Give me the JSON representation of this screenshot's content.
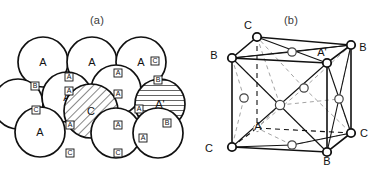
{
  "figure": {
    "panels": [
      {
        "id": "a",
        "caption": "(a)",
        "description": "Close-packed layer of spheres showing A, B and C stacking sites",
        "type": "sphere-packing"
      },
      {
        "id": "b",
        "caption": "(b)",
        "description": "Face-centred cubic unit cell with corner and face-centre atoms labelled",
        "type": "unit-cell"
      }
    ]
  },
  "panel_a": {
    "caption": "(a)",
    "spheres": [
      {
        "name": "sphere-a-top-left",
        "label": "A",
        "cx": 43,
        "cy": 62,
        "r": 25,
        "fill": "plain"
      },
      {
        "name": "sphere-a-top-mid",
        "label": "A",
        "cx": 92,
        "cy": 62,
        "r": 25,
        "fill": "plain"
      },
      {
        "name": "sphere-a-top-right",
        "label": "A",
        "cx": 141,
        "cy": 62,
        "r": 25,
        "fill": "plain"
      },
      {
        "name": "sphere-row2-left",
        "label": "",
        "cx": 18,
        "cy": 104,
        "r": 25,
        "fill": "plain"
      },
      {
        "name": "sphere-a-row2-mid",
        "label": "A",
        "cx": 67,
        "cy": 97,
        "r": 25,
        "fill": "plain"
      },
      {
        "name": "sphere-row2-mid2",
        "label": "",
        "cx": 116,
        "cy": 90,
        "r": 25,
        "fill": "plain"
      },
      {
        "name": "sphere-a-prime",
        "label": "A'",
        "cx": 160,
        "cy": 104,
        "r": 25,
        "fill": "horizontal-hatch"
      },
      {
        "name": "sphere-c-center",
        "label": "C",
        "cx": 91,
        "cy": 111,
        "r": 27,
        "fill": "diagonal-hatch"
      },
      {
        "name": "sphere-a-bottom-left",
        "label": "A",
        "cx": 40,
        "cy": 132,
        "r": 25,
        "fill": "plain"
      },
      {
        "name": "sphere-bottom-mid",
        "label": "",
        "cx": 116,
        "cy": 133,
        "r": 25,
        "fill": "plain"
      },
      {
        "name": "sphere-bottom-right",
        "label": "",
        "cx": 158,
        "cy": 133,
        "r": 25,
        "fill": "plain"
      }
    ],
    "site_labels": [
      {
        "name": "site-label-a-1",
        "label": "A",
        "x": 69,
        "y": 79
      },
      {
        "name": "site-label-a-2",
        "label": "A",
        "x": 118,
        "y": 75
      },
      {
        "name": "site-label-a-3",
        "label": "A",
        "x": 69,
        "y": 93
      },
      {
        "name": "site-label-a-4",
        "label": "A",
        "x": 118,
        "y": 96
      },
      {
        "name": "site-label-a-5",
        "label": "A",
        "x": 139,
        "y": 111
      },
      {
        "name": "site-label-a-6",
        "label": "A",
        "x": 70,
        "y": 127
      },
      {
        "name": "site-label-a-7",
        "label": "A",
        "x": 118,
        "y": 127
      },
      {
        "name": "site-label-a-8",
        "label": "A",
        "x": 143,
        "y": 140
      },
      {
        "name": "site-label-b-1",
        "label": "B",
        "x": 35,
        "y": 88
      },
      {
        "name": "site-label-b-2",
        "label": "B",
        "x": 158,
        "y": 82
      },
      {
        "name": "site-label-b-3",
        "label": "B",
        "x": 167,
        "y": 125
      },
      {
        "name": "site-label-c-1",
        "label": "C",
        "x": 36,
        "y": 112
      },
      {
        "name": "site-label-c-2",
        "label": "C",
        "x": 70,
        "y": 155
      },
      {
        "name": "site-label-c-3",
        "label": "C",
        "x": 118,
        "y": 155
      },
      {
        "name": "site-label-c-4",
        "label": "C",
        "x": 155,
        "y": 63
      }
    ]
  },
  "panel_b": {
    "caption": "(b)",
    "corner_labels": [
      {
        "name": "cube-corner-c-top",
        "label": "C",
        "x": 54,
        "y": 29
      },
      {
        "name": "cube-corner-b-left",
        "label": "B",
        "x": 20,
        "y": 59
      },
      {
        "name": "cube-corner-b-right",
        "label": "B",
        "x": 169,
        "y": 51
      },
      {
        "name": "cube-corner-c-bottom",
        "label": "C",
        "x": 15,
        "y": 152
      },
      {
        "name": "cube-corner-b-front",
        "label": "B",
        "x": 133,
        "y": 165
      },
      {
        "name": "cube-corner-c-right",
        "label": "C",
        "x": 170,
        "y": 137
      }
    ],
    "face_labels": [
      {
        "name": "face-centre-a-prime",
        "label": "A'",
        "x": 128,
        "y": 56
      },
      {
        "name": "face-centre-a",
        "label": "A",
        "x": 64,
        "y": 130
      }
    ],
    "atoms": [
      {
        "name": "atom-corner-back-top-left",
        "cx": 63,
        "cy": 37,
        "r": 4.2,
        "style": "solid"
      },
      {
        "name": "atom-corner-front-top-left",
        "cx": 38,
        "cy": 58,
        "r": 4.2,
        "style": "solid"
      },
      {
        "name": "atom-corner-back-top-right",
        "cx": 157,
        "cy": 45,
        "r": 4.2,
        "style": "solid"
      },
      {
        "name": "atom-corner-front-top-right",
        "cx": 133,
        "cy": 63,
        "r": 4.2,
        "style": "solid"
      },
      {
        "name": "atom-corner-front-bot-left",
        "cx": 38,
        "cy": 147,
        "r": 4.2,
        "style": "solid"
      },
      {
        "name": "atom-corner-front-bot-right",
        "cx": 133,
        "cy": 152,
        "r": 4.2,
        "style": "solid"
      },
      {
        "name": "atom-corner-back-bot-right",
        "cx": 157,
        "cy": 133,
        "r": 4.2,
        "style": "solid"
      },
      {
        "name": "atom-corner-back-bot-left",
        "cx": 63,
        "cy": 128,
        "r": 3.6,
        "style": "hidden"
      },
      {
        "name": "atom-face-top",
        "cx": 98,
        "cy": 52,
        "r": 4.2,
        "style": "open"
      },
      {
        "name": "atom-face-front",
        "cx": 86,
        "cy": 105,
        "r": 4.6,
        "style": "open"
      },
      {
        "name": "atom-face-right",
        "cx": 145,
        "cy": 99,
        "r": 4.2,
        "style": "open"
      },
      {
        "name": "atom-face-left",
        "cx": 50,
        "cy": 98,
        "r": 4.2,
        "style": "open"
      },
      {
        "name": "atom-face-bottom",
        "cx": 98,
        "cy": 145,
        "r": 4.2,
        "style": "open"
      },
      {
        "name": "atom-face-back",
        "cx": 110,
        "cy": 88,
        "r": 4.2,
        "style": "open"
      }
    ]
  }
}
